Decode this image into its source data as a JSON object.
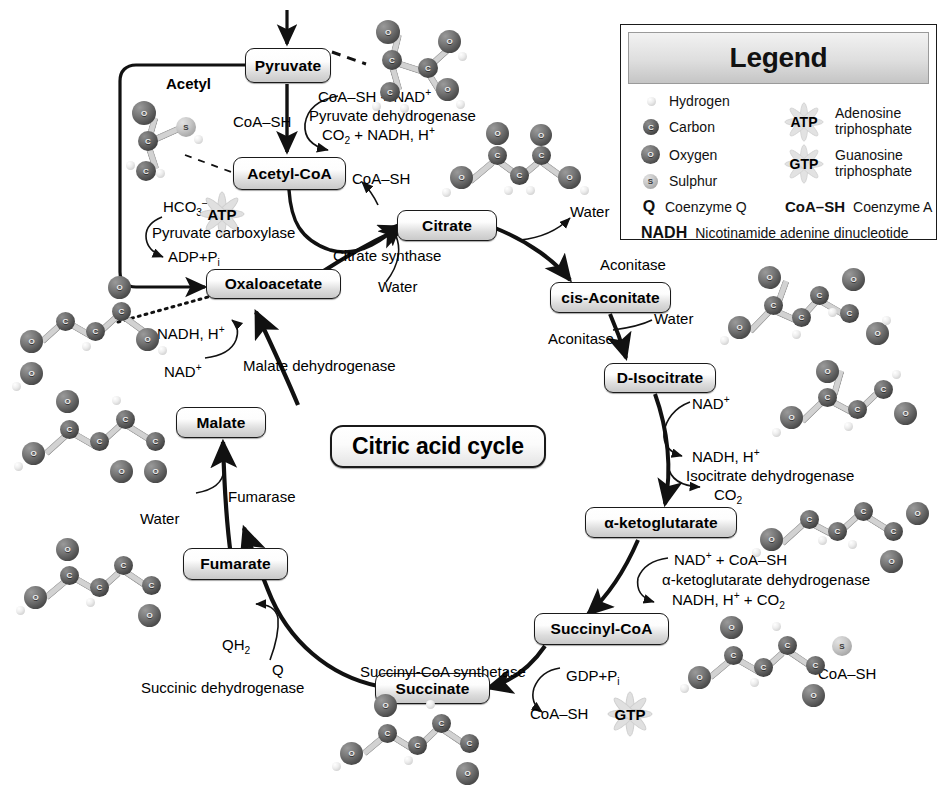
{
  "diagram": {
    "title": "Citric acid cycle",
    "center_label": "Citric acid cycle"
  },
  "nodes": {
    "pyruvate": "Pyruvate",
    "acetyl_coa": "Acetyl-CoA",
    "oxaloacetate": "Oxaloacetate",
    "citrate": "Citrate",
    "cis_aconitate": "cis-Aconitate",
    "d_isocitrate": "D-Isocitrate",
    "alpha_ketoglutarate": "α-ketoglutarate",
    "succinyl_coa": "Succinyl-CoA",
    "succinate": "Succinate",
    "fumarate": "Fumarate",
    "malate": "Malate"
  },
  "labels": {
    "acetyl": "Acetyl",
    "coa_sh_1": "CoA–SH",
    "coa_sh_2": "CoA–SH",
    "coa_sh_gtp": "CoA–SH",
    "coa_sh_succinyl_mol": "CoA–SH",
    "pdh_in": "CoA–SH + NAD",
    "pdh_in_sup": "+",
    "pdh_enzyme": "Pyruvate dehydrogenase",
    "pdh_out": "CO",
    "pdh_out_sub": "2",
    "pdh_out_rest": " + NADH, H",
    "pdh_out_sup": "+",
    "hco3": "HCO",
    "hco3_sub": "3",
    "hco3_sup": "–",
    "hco3_plus": " +",
    "atp": "ATP",
    "pyruvate_carboxylase": "Pyruvate carboxylase",
    "adp_pi": "ADP+P",
    "adp_pi_sub": "i",
    "citrate_synthase": "Citrate synthase",
    "water_citrate": "Water",
    "water_aconitase": "Water",
    "water_aconitase2": "Water",
    "water_fumarase": "Water",
    "aconitase_1": "Aconitase",
    "aconitase_2": "Aconitase",
    "nad_isocitrate": "NAD",
    "nad_isocitrate_sup": "+",
    "nadh_isocitrate": "NADH, H",
    "nadh_isocitrate_sup": "+",
    "isocitrate_dehydrogenase": "Isocitrate dehydrogenase",
    "co2_isocitrate": "CO",
    "co2_isocitrate_sub": "2",
    "akg_in": "NAD",
    "akg_in_sup": "+",
    "akg_in_rest": " + CoA–SH",
    "akg_enzyme": "α-ketoglutarate dehydrogenase",
    "akg_out": "NADH, H",
    "akg_out_sup": "+",
    "akg_out_rest": " + CO",
    "akg_out_sub": "2",
    "gdp_pi": "GDP+P",
    "gdp_pi_sub": "i",
    "gtp": "GTP",
    "succinyl_coa_synthetase": "Succinyl-CoA synthetase",
    "qh2": "QH",
    "qh2_sub": "2",
    "q": "Q",
    "succinic_dehydrogenase": "Succinic dehydrogenase",
    "fumarase": "Fumarase",
    "malate_dehydrogenase": "Malate dehydrogenase",
    "nadh_malate": "NADH, H",
    "nadh_malate_sup": "+",
    "nad_malate": "NAD",
    "nad_malate_sup": "+"
  },
  "legend": {
    "title": "Legend",
    "atoms": [
      {
        "symbol": "",
        "type": "H",
        "label": "Hydrogen"
      },
      {
        "symbol": "C",
        "type": "C",
        "label": "Carbon"
      },
      {
        "symbol": "O",
        "type": "O",
        "label": "Oxygen"
      },
      {
        "symbol": "S",
        "type": "S",
        "label": "Sulphur"
      }
    ],
    "coenzyme_q_symbol": "Q",
    "coenzyme_q_label": "Coenzyme Q",
    "energy": [
      {
        "symbol": "ATP",
        "line1": "Adenosine",
        "line2": "triphosphate"
      },
      {
        "symbol": "GTP",
        "line1": "Guanosine",
        "line2": "triphosphate"
      }
    ],
    "coa_symbol": "CoA–SH",
    "coa_label": "Coenzyme A",
    "nadh_symbol": "NADH",
    "nadh_label": "Nicotinamide adenine dinucleotide"
  },
  "colors": {
    "stroke": "#1a1a1a",
    "box_fill_light": "#ffffff",
    "box_fill_dark": "#c9c9c9",
    "carbon": "#4a4a4a",
    "oxygen": "#5a5a5a",
    "sulphur": "#c9c9c9",
    "hydrogen": "#ededed",
    "burst": "#e3e3e3"
  }
}
